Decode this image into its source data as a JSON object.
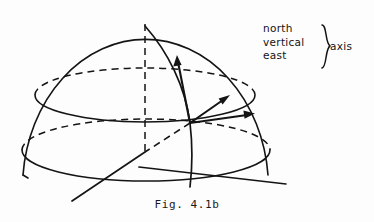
{
  "figure": {
    "caption": "Fig. 4.1b",
    "background_color": "#fdfdfd",
    "ink_color": "#141414"
  },
  "legend": {
    "lines": [
      "north",
      "vertical",
      "east"
    ],
    "brace_glyph": "}",
    "group_label": "axis"
  },
  "geometry": {
    "origin": {
      "x": 190,
      "y": 123
    },
    "apex": {
      "x": 145,
      "y": 26
    },
    "dome": {
      "left_base": {
        "x": 23,
        "y": 175
      },
      "right_base": {
        "x": 268,
        "y": 175
      },
      "radius_x": 123,
      "radius_y": 149
    },
    "upper_ellipse": {
      "cx": 145,
      "cy": 95,
      "rx": 110,
      "ry": 27
    },
    "base_ellipse": {
      "cx": 146,
      "cy": 150,
      "rx": 124,
      "ry": 31
    },
    "vertical_dashed_axis": {
      "from": {
        "x": 145,
        "y": 26
      },
      "to": {
        "x": 145,
        "y": 152
      }
    },
    "meridian": {
      "from": {
        "x": 145,
        "y": 26
      },
      "to": {
        "x": 190,
        "y": 187
      }
    },
    "north_ground_line": {
      "from": {
        "x": 190,
        "y": 123
      },
      "to": {
        "x": 72,
        "y": 201
      }
    },
    "east_ground_line": {
      "from": {
        "x": 140,
        "y": 167
      },
      "to": {
        "x": 286,
        "y": 184
      }
    }
  },
  "vectors": [
    {
      "name": "vertical",
      "from": {
        "x": 190,
        "y": 123
      },
      "to": {
        "x": 177,
        "y": 57
      }
    },
    {
      "name": "north",
      "from": {
        "x": 190,
        "y": 123
      },
      "to": {
        "x": 229,
        "y": 96
      }
    },
    {
      "name": "east",
      "from": {
        "x": 190,
        "y": 123
      },
      "to": {
        "x": 254,
        "y": 114
      }
    }
  ]
}
